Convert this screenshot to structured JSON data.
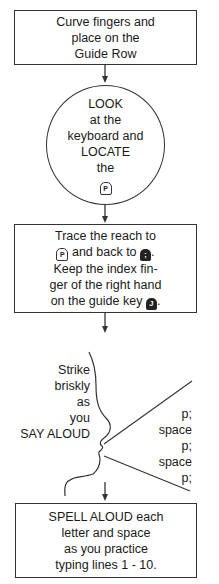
{
  "steps": {
    "step1": {
      "lines": [
        "Curve fingers and",
        "place on the",
        "Guide Row"
      ]
    },
    "step2": {
      "lines": [
        "LOOK",
        "at the",
        "keyboard and",
        "LOCATE",
        "the"
      ],
      "key": "P"
    },
    "step3": {
      "line1": "Trace the reach to",
      "line2_key_start": "P",
      "line2_text": "and back to",
      "line2_key_end": ";",
      "line2_suffix": ".",
      "line3": "Keep the index fin-",
      "line4": "ger of the right hand",
      "line5_text": "on the guide key",
      "line5_key": "J",
      "line5_suffix": "."
    },
    "step4": {
      "instruction_lines": [
        "Strike",
        "briskly",
        "as",
        "you",
        "SAY ALOUD"
      ],
      "spoken_lines": [
        "p;",
        "space",
        "p;",
        "space",
        "p;"
      ]
    },
    "step5": {
      "lines": [
        "SPELL ALOUD each",
        "letter and space",
        "as you practice",
        "typing lines 1 - 10."
      ]
    }
  },
  "colors": {
    "stroke": "#333333",
    "text": "#1a1a1a",
    "background": "#ffffff"
  }
}
